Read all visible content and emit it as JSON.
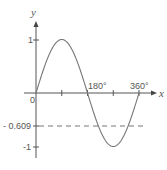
{
  "chart_data": {
    "type": "line",
    "title": "",
    "xlabel": "x",
    "ylabel": "y",
    "function": "y = sin x",
    "x_range_deg": [
      0,
      360
    ],
    "ylim": [
      -1,
      1
    ],
    "x_ticks": [
      0,
      90,
      180,
      270,
      360
    ],
    "x_tick_labels": [
      "0",
      "",
      "180°",
      "",
      "360°"
    ],
    "y_ticks": [
      1,
      -0.609,
      -1
    ],
    "y_tick_labels": [
      "1",
      "- 0.609",
      "-1"
    ],
    "series": [
      {
        "name": "sin x",
        "x": [
          0,
          30,
          60,
          90,
          120,
          150,
          180,
          210,
          240,
          270,
          300,
          330,
          360
        ],
        "values": [
          0,
          0.5,
          0.866,
          1,
          0.866,
          0.5,
          0,
          -0.5,
          -0.866,
          -1,
          -0.866,
          -0.5,
          0
        ]
      }
    ],
    "annotations": [
      {
        "type": "horizontal_dashed_line",
        "y": -0.609
      }
    ],
    "grid": false,
    "legend": "none"
  },
  "labels": {
    "x_axis": "x",
    "y_axis": "y",
    "origin": "0",
    "tick_180": "180°",
    "tick_360": "360°",
    "y_one": "1",
    "y_neg_one": "-1",
    "y_dashed": "- 0.609"
  }
}
